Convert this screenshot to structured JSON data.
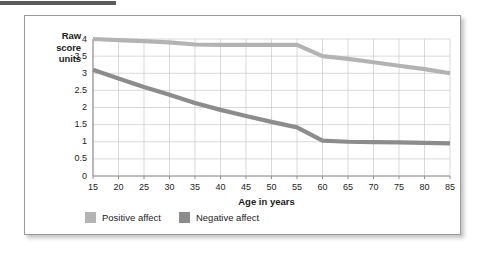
{
  "figure": {
    "y_axis_title_lines": [
      "Raw",
      "score",
      "units"
    ],
    "x_axis_title": "Age in years"
  },
  "legend": {
    "entries": [
      {
        "label": "Positive affect",
        "color": "#b3b3b3",
        "icon": "legend-swatch-icon"
      },
      {
        "label": "Negative affect",
        "color": "#8c8c8c",
        "icon": "legend-swatch-icon"
      }
    ]
  },
  "chart_data": {
    "type": "line",
    "title": "",
    "subtitle": "",
    "xlabel": "Age in years",
    "ylabel": "Raw score units",
    "xlim": [
      15,
      85
    ],
    "ylim": [
      0,
      4
    ],
    "grid": true,
    "legend_position": "bottom-left",
    "x": [
      15,
      20,
      25,
      30,
      35,
      40,
      45,
      50,
      55,
      60,
      65,
      70,
      75,
      80,
      85
    ],
    "xticklabels": [
      "15",
      "20",
      "25",
      "30",
      "35",
      "40",
      "45",
      "50",
      "55",
      "60",
      "65",
      "70",
      "75",
      "80",
      "85"
    ],
    "yticks": [
      0,
      0.5,
      1,
      1.5,
      2,
      2.5,
      3,
      3.5,
      4
    ],
    "yticklabels": [
      "0",
      "0.5",
      "1",
      "1.5",
      "2",
      "2.5",
      "3",
      "3.5",
      "4"
    ],
    "series": [
      {
        "name": "Positive affect",
        "color": "#b3b3b3",
        "values": [
          4.0,
          3.97,
          3.94,
          3.9,
          3.84,
          3.83,
          3.83,
          3.83,
          3.83,
          3.5,
          3.42,
          3.32,
          3.22,
          3.12,
          3.0
        ]
      },
      {
        "name": "Negative affect",
        "color": "#8c8c8c",
        "values": [
          3.1,
          2.85,
          2.6,
          2.37,
          2.13,
          1.93,
          1.75,
          1.58,
          1.42,
          1.03,
          1.0,
          0.99,
          0.98,
          0.97,
          0.95
        ]
      }
    ]
  }
}
